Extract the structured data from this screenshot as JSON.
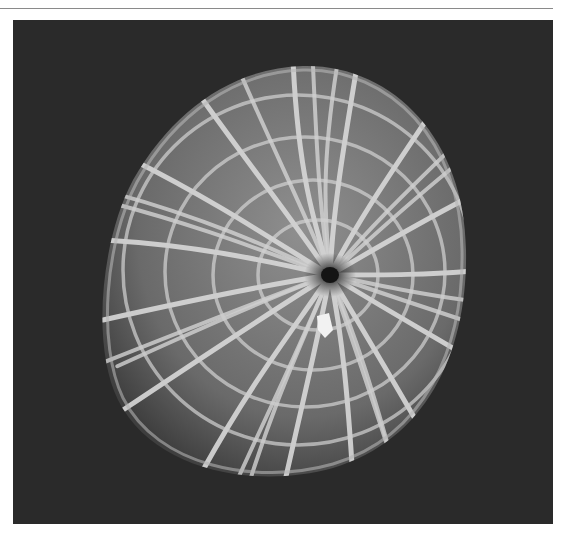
{
  "figure": {
    "kind": "scanning electron micrograph",
    "colors": {
      "page_background": "#ffffff",
      "rule": "#8a8a8a",
      "panel_background": "#2a2a2a",
      "grain_shadow": "#4a4a4a",
      "grain_ridges": "#d8d8d8",
      "aperture": "#1a1a1a"
    },
    "alt": "SEM image of a pollen grain on a dark background"
  }
}
